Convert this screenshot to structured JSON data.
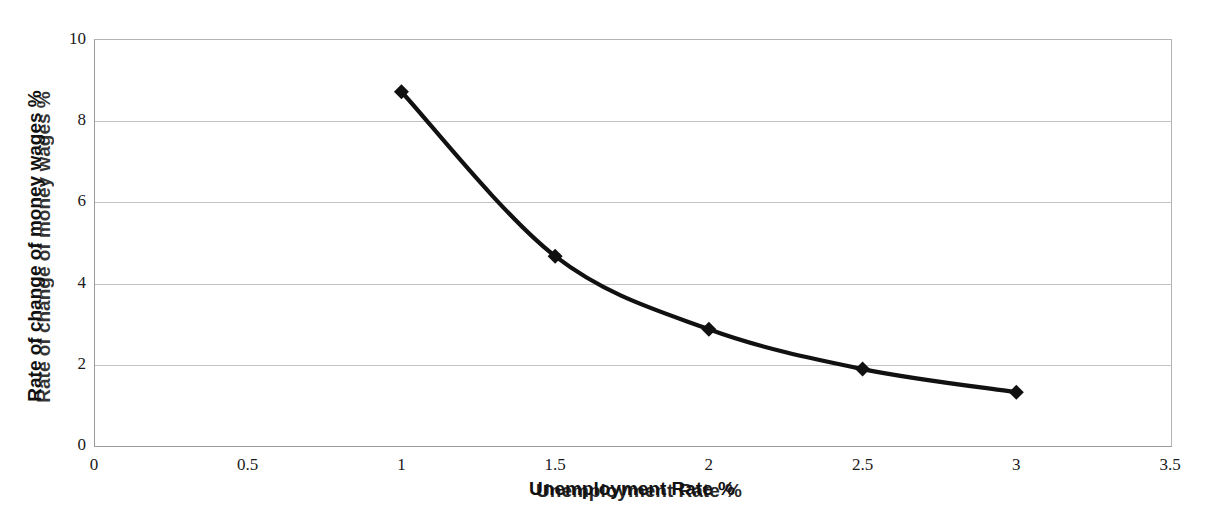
{
  "chart_data": {
    "type": "line",
    "title": "",
    "xlabel": "Unemployment Rate %",
    "ylabel": "Rate of change of money wages %",
    "xlim": [
      0,
      3.5
    ],
    "ylim": [
      0,
      10
    ],
    "xticks": [
      "0",
      "0.5",
      "1",
      "1.5",
      "2",
      "2.5",
      "3",
      "3.5"
    ],
    "xtick_values": [
      0,
      0.5,
      1,
      1.5,
      2,
      2.5,
      3,
      3.5
    ],
    "yticks": [
      "0",
      "2",
      "4",
      "6",
      "8",
      "10"
    ],
    "ytick_values": [
      0,
      2,
      4,
      6,
      8,
      10
    ],
    "grid": "horizontal",
    "legend": "none",
    "series": [
      {
        "name": "Phillips curve",
        "marker": "diamond",
        "color": "#111111",
        "smooth": true,
        "x": [
          1,
          1.5,
          2,
          2.5,
          3
        ],
        "y": [
          8.7,
          4.65,
          2.85,
          1.87,
          1.3
        ]
      }
    ]
  },
  "axes": {
    "y_label_text": "Rate of change of money wages %",
    "y_label_ghost_text": "Rate of change of money wages %",
    "x_label_text": "Unemployment Rate %",
    "x_label_ghost_text": "Unemployment Rate %"
  },
  "colors": {
    "series": "#111111",
    "gridline": "#c3c3c3",
    "axis": "#9a9a9a",
    "background": "#ffffff",
    "tick_text": "#1a1a1a"
  }
}
